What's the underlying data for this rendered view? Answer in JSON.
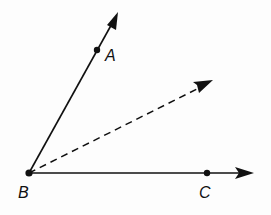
{
  "diagram": {
    "type": "angle-with-bisector",
    "points": {
      "B": {
        "label": "B",
        "x": 29,
        "y": 173
      },
      "A": {
        "label": "A",
        "x": 97,
        "y": 50
      },
      "C": {
        "label": "C",
        "x": 207,
        "y": 173
      }
    },
    "rays": [
      {
        "name": "ray-BA",
        "from": "B",
        "style": "solid",
        "tip": [
          118,
          13
        ]
      },
      {
        "name": "ray-BC",
        "from": "B",
        "style": "solid",
        "tip": [
          253,
          173
        ]
      },
      {
        "name": "bisector-ray",
        "from": "B",
        "style": "dashed",
        "tip": [
          212,
          81
        ]
      }
    ],
    "colors": {
      "stroke": "#111111",
      "background": "#fdfdfd"
    }
  }
}
